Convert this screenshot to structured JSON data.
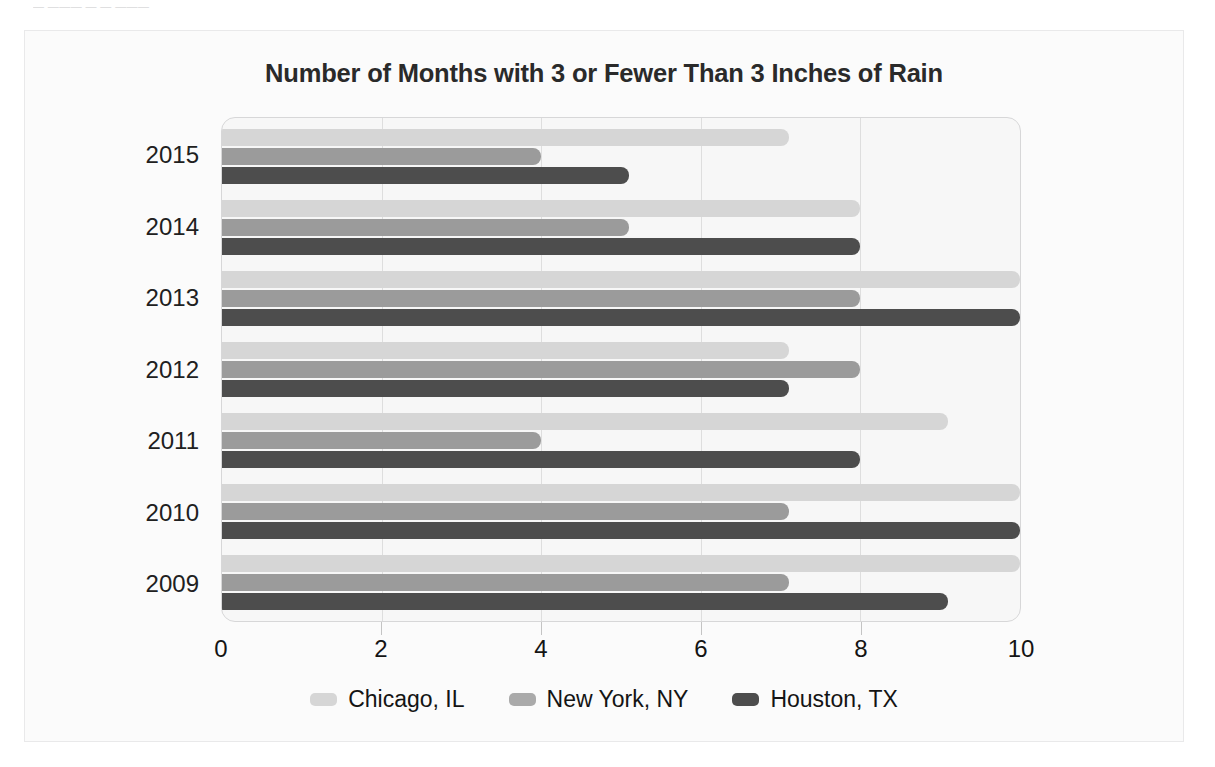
{
  "page_fragment": "— ——— — — ———",
  "chart_data": {
    "type": "bar",
    "orientation": "horizontal",
    "title": "Number of Months with 3 or Fewer Than 3 Inches of Rain",
    "xlabel": "",
    "ylabel": "",
    "xlim": [
      0,
      10
    ],
    "ylim": null,
    "grid": true,
    "legend_position": "bottom",
    "categories": [
      "2015",
      "2014",
      "2013",
      "2012",
      "2011",
      "2010",
      "2009"
    ],
    "xticks": [
      "0",
      "2",
      "4",
      "6",
      "8",
      "10"
    ],
    "xtick_values": [
      0,
      2,
      4,
      6,
      8,
      10
    ],
    "series": [
      {
        "name": "Chicago, IL",
        "color": "#d6d6d6",
        "values": [
          7.1,
          8,
          10,
          7.1,
          9.1,
          10,
          10
        ]
      },
      {
        "name": "New York, NY",
        "color": "#9b9b9b",
        "values": [
          4,
          5.1,
          8,
          8,
          4,
          7.1,
          7.1
        ]
      },
      {
        "name": "Houston, TX",
        "color": "#4d4d4d",
        "values": [
          5.1,
          8,
          10,
          7.1,
          8,
          10,
          9.1
        ]
      }
    ]
  },
  "legend": {
    "items": [
      {
        "label": "Chicago, IL",
        "swatch": "chi"
      },
      {
        "label": "New York, NY",
        "swatch": "nyc"
      },
      {
        "label": "Houston, TX",
        "swatch": "hou"
      }
    ]
  },
  "colors": {
    "chicago": "#d6d6d6",
    "new_york": "#9b9b9b",
    "houston": "#4d4d4d",
    "plot_background": "#f7f7f7",
    "card_background": "#fbfbfb",
    "gridline": "#dedede"
  }
}
